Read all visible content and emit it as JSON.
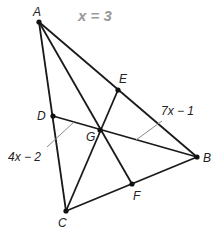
{
  "annotation": {
    "equation": "x = 3"
  },
  "points": {
    "A": {
      "label": "A",
      "x": 39,
      "y": 22,
      "lx": 33,
      "ly": 16
    },
    "B": {
      "label": "B",
      "x": 197,
      "y": 157,
      "lx": 203,
      "ly": 162
    },
    "C": {
      "label": "C",
      "x": 66,
      "y": 211,
      "lx": 58,
      "ly": 227
    },
    "D": {
      "label": "D",
      "x": 53,
      "y": 116,
      "lx": 37,
      "ly": 120
    },
    "E": {
      "label": "E",
      "x": 118,
      "y": 90,
      "lx": 119,
      "ly": 83
    },
    "F": {
      "label": "F",
      "x": 132,
      "y": 184,
      "lx": 133,
      "ly": 200
    },
    "G": {
      "label": "G",
      "x": 100,
      "y": 130,
      "lx": 86,
      "ly": 141
    }
  },
  "segments": [
    [
      "A",
      "B"
    ],
    [
      "B",
      "C"
    ],
    [
      "C",
      "A"
    ],
    [
      "A",
      "F"
    ],
    [
      "C",
      "E"
    ],
    [
      "D",
      "B"
    ]
  ],
  "measures": {
    "DG": {
      "expr": "4x − 2"
    },
    "GB": {
      "expr": "7x − 1"
    }
  }
}
